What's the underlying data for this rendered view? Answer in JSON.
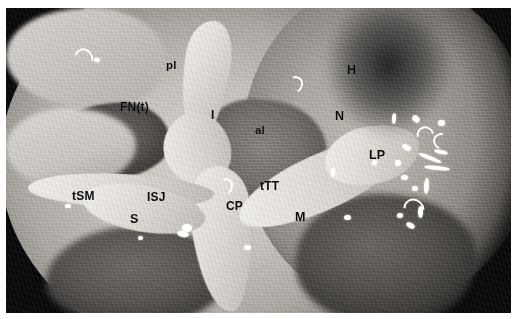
{
  "figure": {
    "kind": "endoscopic-anatomical-photograph",
    "modality": "endoscopic view of the middle ear",
    "rendering": "grayscale photograph",
    "border_color": "#ffffff",
    "background_color": "#060606",
    "label_color": "#0c0c0c"
  },
  "labels": [
    {
      "id": "pl",
      "text": "pl",
      "x": 160,
      "y": 52,
      "size": 11.5
    },
    {
      "id": "H",
      "text": "H",
      "x": 341,
      "y": 56,
      "size": 12.5
    },
    {
      "id": "FNt",
      "text": "FN(t)",
      "x": 114,
      "y": 93,
      "size": 12
    },
    {
      "id": "I",
      "text": "I",
      "x": 205,
      "y": 101,
      "size": 12
    },
    {
      "id": "N",
      "text": "N",
      "x": 329,
      "y": 102,
      "size": 12.5
    },
    {
      "id": "al",
      "text": "al",
      "x": 249,
      "y": 117,
      "size": 11.5
    },
    {
      "id": "LP",
      "text": "LP",
      "x": 363,
      "y": 141,
      "size": 12.5
    },
    {
      "id": "tSM",
      "text": "tSM",
      "x": 66,
      "y": 182,
      "size": 12
    },
    {
      "id": "ISJ",
      "text": "ISJ",
      "x": 141,
      "y": 183,
      "size": 12
    },
    {
      "id": "tTT",
      "text": "tTT",
      "x": 254,
      "y": 172,
      "size": 12
    },
    {
      "id": "CP",
      "text": "CP",
      "x": 220,
      "y": 192,
      "size": 12
    },
    {
      "id": "S",
      "text": "S",
      "x": 124,
      "y": 205,
      "size": 12.5
    },
    {
      "id": "M",
      "text": "M",
      "x": 289,
      "y": 203,
      "size": 12.5
    }
  ],
  "highlights": [
    {
      "id": "hl-1",
      "shape": "crescent",
      "x": 69,
      "y": 40,
      "w": 14,
      "h": 16,
      "rot": 150
    },
    {
      "id": "hl-2",
      "shape": "dot",
      "x": 88,
      "y": 50,
      "w": 6,
      "h": 4,
      "rot": 20
    },
    {
      "id": "hl-3",
      "shape": "crescent",
      "x": 282,
      "y": 68,
      "w": 11,
      "h": 13,
      "rot": 200
    },
    {
      "id": "hl-4",
      "shape": "crescent",
      "x": 213,
      "y": 170,
      "w": 10,
      "h": 13,
      "rot": 195
    },
    {
      "id": "hl-5",
      "shape": "dot",
      "x": 176,
      "y": 216,
      "w": 10,
      "h": 8,
      "rot": 0
    },
    {
      "id": "hl-6",
      "shape": "dot",
      "x": 171,
      "y": 223,
      "w": 12,
      "h": 6,
      "rot": 10
    },
    {
      "id": "hl-7",
      "shape": "dot",
      "x": 59,
      "y": 196,
      "w": 6,
      "h": 4,
      "rot": 0
    },
    {
      "id": "hl-8",
      "shape": "dot",
      "x": 132,
      "y": 228,
      "w": 5,
      "h": 4,
      "rot": 0
    },
    {
      "id": "hl-9",
      "shape": "dot",
      "x": 338,
      "y": 207,
      "w": 7,
      "h": 5,
      "rot": 0
    },
    {
      "id": "hl-10",
      "shape": "dot",
      "x": 325,
      "y": 160,
      "w": 4,
      "h": 9,
      "rot": 8
    },
    {
      "id": "hl-11",
      "shape": "dot",
      "x": 386,
      "y": 105,
      "w": 4,
      "h": 11,
      "rot": 4
    },
    {
      "id": "hl-12",
      "shape": "dot",
      "x": 406,
      "y": 108,
      "w": 8,
      "h": 6,
      "rot": 40
    },
    {
      "id": "hl-13",
      "shape": "crescent",
      "x": 411,
      "y": 118,
      "w": 13,
      "h": 14,
      "rot": 120
    },
    {
      "id": "hl-14",
      "shape": "dot",
      "x": 432,
      "y": 112,
      "w": 7,
      "h": 6,
      "rot": 0
    },
    {
      "id": "hl-15",
      "shape": "crescent",
      "x": 427,
      "y": 125,
      "w": 12,
      "h": 12,
      "rot": 60
    },
    {
      "id": "hl-16",
      "shape": "dot",
      "x": 396,
      "y": 137,
      "w": 9,
      "h": 5,
      "rot": 25
    },
    {
      "id": "hl-17",
      "shape": "dot",
      "x": 412,
      "y": 148,
      "w": 24,
      "h": 4,
      "rot": 22
    },
    {
      "id": "hl-18",
      "shape": "dot",
      "x": 418,
      "y": 158,
      "w": 26,
      "h": 4,
      "rot": 6
    },
    {
      "id": "hl-19",
      "shape": "dot",
      "x": 389,
      "y": 152,
      "w": 6,
      "h": 6,
      "rot": 0
    },
    {
      "id": "hl-20",
      "shape": "dot",
      "x": 395,
      "y": 167,
      "w": 7,
      "h": 5,
      "rot": 0
    },
    {
      "id": "hl-21",
      "shape": "dot",
      "x": 406,
      "y": 178,
      "w": 6,
      "h": 5,
      "rot": 0
    },
    {
      "id": "hl-22",
      "shape": "dot",
      "x": 418,
      "y": 170,
      "w": 5,
      "h": 16,
      "rot": 4
    },
    {
      "id": "hl-23",
      "shape": "crescent",
      "x": 398,
      "y": 190,
      "w": 16,
      "h": 18,
      "rot": 135
    },
    {
      "id": "hl-24",
      "shape": "dot",
      "x": 391,
      "y": 205,
      "w": 6,
      "h": 5,
      "rot": 0
    },
    {
      "id": "hl-25",
      "shape": "dot",
      "x": 400,
      "y": 215,
      "w": 9,
      "h": 5,
      "rot": 30
    },
    {
      "id": "hl-26",
      "shape": "dot",
      "x": 412,
      "y": 198,
      "w": 5,
      "h": 12,
      "rot": 0
    },
    {
      "id": "hl-27",
      "shape": "dot",
      "x": 428,
      "y": 142,
      "w": 14,
      "h": 4,
      "rot": 12
    },
    {
      "id": "hl-28",
      "shape": "dot",
      "x": 366,
      "y": 152,
      "w": 5,
      "h": 5,
      "rot": 0
    },
    {
      "id": "hl-29",
      "shape": "dot",
      "x": 238,
      "y": 237,
      "w": 7,
      "h": 5,
      "rot": 0
    }
  ]
}
